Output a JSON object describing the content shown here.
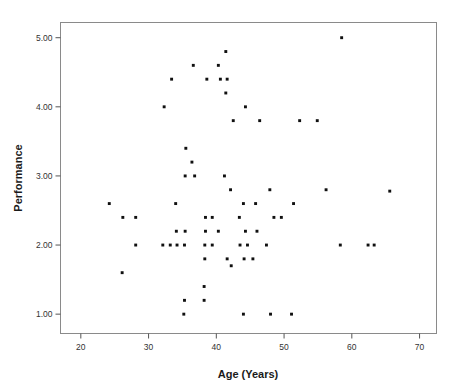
{
  "chart_data": {
    "type": "scatter",
    "title": "",
    "xlabel": "Age (Years)",
    "ylabel": "Performance",
    "xlim": [
      17,
      72.5
    ],
    "ylim": [
      0.72,
      5.22
    ],
    "xticks": [
      20,
      30,
      40,
      50,
      60,
      70
    ],
    "xtick_labels": [
      "20",
      "30",
      "40",
      "50",
      "60",
      "70"
    ],
    "yticks": [
      1.0,
      2.0,
      3.0,
      4.0,
      5.0
    ],
    "ytick_labels": [
      "1.00",
      "2.00",
      "3.00",
      "4.00",
      "5.00"
    ],
    "grid": false,
    "legend": null,
    "marker": "filled-square",
    "marker_color": "#101010",
    "points": [
      [
        58.5,
        5.0
      ],
      [
        41.4,
        4.8
      ],
      [
        36.6,
        4.6
      ],
      [
        40.3,
        4.6
      ],
      [
        33.4,
        4.4
      ],
      [
        38.6,
        4.4
      ],
      [
        40.6,
        4.4
      ],
      [
        41.6,
        4.4
      ],
      [
        41.4,
        4.2
      ],
      [
        32.3,
        4.0
      ],
      [
        44.3,
        4.0
      ],
      [
        42.5,
        3.8
      ],
      [
        46.4,
        3.8
      ],
      [
        52.3,
        3.8
      ],
      [
        54.9,
        3.8
      ],
      [
        35.5,
        3.4
      ],
      [
        36.4,
        3.2
      ],
      [
        35.4,
        3.0
      ],
      [
        36.8,
        3.0
      ],
      [
        41.2,
        3.0
      ],
      [
        42.1,
        2.8
      ],
      [
        47.9,
        2.8
      ],
      [
        56.2,
        2.8
      ],
      [
        65.6,
        2.78
      ],
      [
        24.2,
        2.6
      ],
      [
        34.0,
        2.6
      ],
      [
        44.0,
        2.6
      ],
      [
        45.8,
        2.6
      ],
      [
        51.4,
        2.6
      ],
      [
        26.2,
        2.4
      ],
      [
        28.1,
        2.4
      ],
      [
        38.4,
        2.4
      ],
      [
        39.4,
        2.4
      ],
      [
        43.4,
        2.4
      ],
      [
        48.5,
        2.4
      ],
      [
        49.6,
        2.4
      ],
      [
        34.1,
        2.2
      ],
      [
        35.4,
        2.2
      ],
      [
        38.4,
        2.2
      ],
      [
        40.3,
        2.2
      ],
      [
        44.3,
        2.2
      ],
      [
        46.0,
        2.2
      ],
      [
        28.1,
        2.0
      ],
      [
        32.1,
        2.0
      ],
      [
        33.2,
        2.0
      ],
      [
        34.2,
        2.0
      ],
      [
        35.3,
        2.0
      ],
      [
        38.3,
        2.0
      ],
      [
        39.4,
        2.0
      ],
      [
        43.5,
        2.0
      ],
      [
        44.6,
        2.0
      ],
      [
        47.4,
        2.0
      ],
      [
        58.3,
        2.0
      ],
      [
        62.4,
        2.0
      ],
      [
        63.3,
        2.0
      ],
      [
        38.3,
        1.8
      ],
      [
        41.6,
        1.8
      ],
      [
        44.1,
        1.8
      ],
      [
        45.4,
        1.8
      ],
      [
        42.2,
        1.7
      ],
      [
        26.1,
        1.6
      ],
      [
        38.2,
        1.4
      ],
      [
        35.3,
        1.2
      ],
      [
        38.2,
        1.2
      ],
      [
        35.2,
        1.0
      ],
      [
        44.0,
        1.0
      ],
      [
        48.0,
        1.0
      ],
      [
        51.1,
        1.0
      ]
    ]
  },
  "style": {
    "plot_border_color": "#808080",
    "background_color": "#ffffff",
    "tick_color": "#555555"
  }
}
